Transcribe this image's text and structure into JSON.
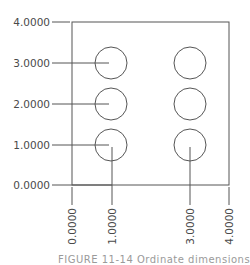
{
  "drawing": {
    "type": "ordinate-dimensioned-plate",
    "stroke_color": "#555555",
    "label_color": "#4a4a4a",
    "plate": {
      "x_min": 0.0,
      "x_max": 4.0,
      "y_min": 0.0,
      "y_max": 4.0
    },
    "y_ordinates": [
      "0.0000",
      "1.0000",
      "2.0000",
      "3.0000",
      "4.0000"
    ],
    "x_ordinates": [
      "0.0000",
      "1.0000",
      "3.0000",
      "4.0000"
    ],
    "holes": [
      {
        "x": 1.0,
        "y": 3.0
      },
      {
        "x": 1.0,
        "y": 2.0
      },
      {
        "x": 1.0,
        "y": 1.0
      },
      {
        "x": 3.0,
        "y": 3.0
      },
      {
        "x": 3.0,
        "y": 2.0
      },
      {
        "x": 3.0,
        "y": 1.0
      }
    ],
    "caption": "FIGURE 11-14   Ordinate dimensions"
  }
}
